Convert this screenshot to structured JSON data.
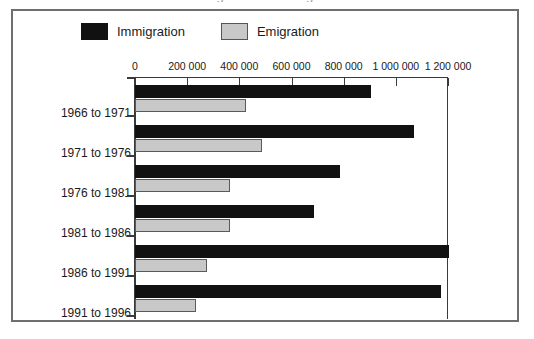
{
  "figure": {
    "title_remnant": "Immigration and emigration",
    "legend": [
      {
        "key": "immigration",
        "label": "Immigration",
        "color": "#111111",
        "swatch": "immigration-swatch"
      },
      {
        "key": "emigration",
        "label": "Emigration",
        "color": "#c8c8c8",
        "swatch": "emigration-swatch"
      }
    ],
    "frame_color": "#6f6f6f",
    "axis_color": "#3a3a3a"
  },
  "chart_data": {
    "type": "bar",
    "orientation": "horizontal",
    "title": "",
    "subtitle": "",
    "xlabel": "",
    "ylabel": "",
    "categories": [
      "1966 to 1971",
      "1971 to 1976",
      "1976 to 1981",
      "1981 to 1986",
      "1986 to 1991",
      "1991 to 1996"
    ],
    "series": [
      {
        "name": "Immigration",
        "color": "#111111",
        "values": [
          905000,
          1069000,
          785000,
          685000,
          1204000,
          1173000
        ]
      },
      {
        "name": "Emigration",
        "color": "#c8c8c8",
        "values": [
          427000,
          485000,
          365000,
          365000,
          277000,
          235000
        ]
      }
    ],
    "xlim": [
      0,
      1200000
    ],
    "xticks": [
      0,
      200000,
      400000,
      600000,
      800000,
      1000000,
      1200000
    ],
    "xtick_labels": [
      "0",
      "200 000",
      "400 000",
      "600 000",
      "800 000",
      "1 000 000",
      "1 200 000"
    ],
    "grid": true,
    "legend_position": "top-left"
  }
}
